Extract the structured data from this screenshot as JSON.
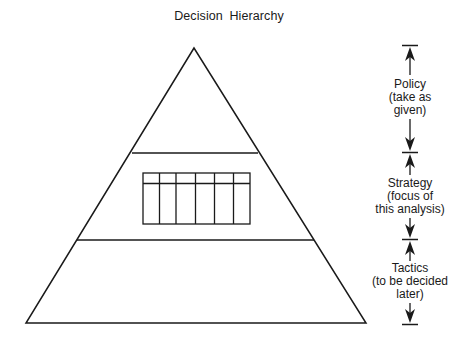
{
  "title": "Decision Hierarchy",
  "pyramid": {
    "levels": [
      "Policy",
      "Strategy",
      "Tactics"
    ],
    "strategy_grid": {
      "columns": 6,
      "has_header_row": true
    }
  },
  "scale": {
    "items": [
      {
        "name": "policy",
        "lines": [
          "Policy",
          "(take as",
          "given)"
        ]
      },
      {
        "name": "strategy",
        "lines": [
          "Strategy",
          "(focus of",
          "this analysis)"
        ]
      },
      {
        "name": "tactics",
        "lines": [
          "Tactics",
          "(to be decided",
          "later)"
        ]
      }
    ]
  },
  "colors": {
    "line": "#1a1a1a",
    "background": "#ffffff"
  }
}
